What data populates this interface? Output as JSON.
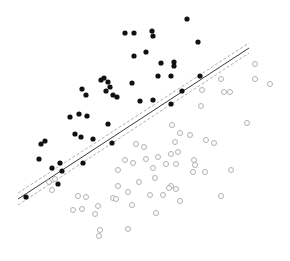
{
  "figure": {
    "width": 290,
    "height": 261,
    "background_color": "#ffffff",
    "has_axes": false,
    "has_border": false,
    "has_gridlines": false,
    "has_tick_labels": false,
    "title": "",
    "xlabel": "",
    "ylabel": ""
  },
  "style": {
    "filled_marker_color": "#111111",
    "filled_marker_radius": 2.6,
    "open_marker_stroke": "#a8a8a8",
    "open_marker_fill": "#ffffff",
    "open_marker_radius": 2.5,
    "open_marker_stroke_width": 0.9,
    "fit_line_color": "#3a3a3a",
    "fit_line_width": 1.0,
    "band_line_color": "#9a9a9a",
    "band_line_width": 0.8,
    "band_dash": "3 2"
  },
  "chart_data": {
    "type": "scatter",
    "title": "",
    "xlabel": "",
    "ylabel": "",
    "xlim": [
      0,
      290
    ],
    "ylim": [
      261,
      0
    ],
    "grid": false,
    "legend_position": "none",
    "annotations": [],
    "series": [
      {
        "name": "filled-group",
        "marker": "filled-circle",
        "color": "#111111",
        "count": 45,
        "points": [
          [
            187,
            19
          ],
          [
            125,
            33
          ],
          [
            134,
            33
          ],
          [
            152,
            31
          ],
          [
            153,
            36
          ],
          [
            198,
            42
          ],
          [
            134,
            56
          ],
          [
            146,
            52
          ],
          [
            161,
            63
          ],
          [
            174,
            62
          ],
          [
            174,
            66
          ],
          [
            158,
            76
          ],
          [
            171,
            76
          ],
          [
            101,
            80
          ],
          [
            104,
            78
          ],
          [
            108,
            82
          ],
          [
            110,
            87
          ],
          [
            106,
            91
          ],
          [
            132,
            83
          ],
          [
            82,
            89
          ],
          [
            86,
            95
          ],
          [
            113,
            95
          ],
          [
            117,
            97
          ],
          [
            200,
            76
          ],
          [
            182,
            91
          ],
          [
            140,
            101
          ],
          [
            153,
            100
          ],
          [
            171,
            104
          ],
          [
            70,
            117
          ],
          [
            79,
            114
          ],
          [
            87,
            116
          ],
          [
            108,
            124
          ],
          [
            75,
            134
          ],
          [
            81,
            137
          ],
          [
            93,
            139
          ],
          [
            41,
            144
          ],
          [
            45,
            141
          ],
          [
            112,
            143
          ],
          [
            39,
            159
          ],
          [
            60,
            163
          ],
          [
            62,
            171
          ],
          [
            83,
            163
          ],
          [
            52,
            168
          ],
          [
            58,
            184
          ],
          [
            26,
            197
          ]
        ]
      },
      {
        "name": "open-group",
        "marker": "open-circle",
        "color": "#a8a8a8",
        "count": 55,
        "points": [
          [
            255,
            64
          ],
          [
            221,
            79
          ],
          [
            255,
            79
          ],
          [
            270,
            84
          ],
          [
            202,
            90
          ],
          [
            224,
            92
          ],
          [
            230,
            92
          ],
          [
            201,
            106
          ],
          [
            247,
            123
          ],
          [
            172,
            125
          ],
          [
            180,
            133
          ],
          [
            190,
            135
          ],
          [
            175,
            142
          ],
          [
            206,
            140
          ],
          [
            214,
            143
          ],
          [
            136,
            144
          ],
          [
            144,
            147
          ],
          [
            171,
            154
          ],
          [
            178,
            152
          ],
          [
            194,
            160
          ],
          [
            158,
            157
          ],
          [
            166,
            164
          ],
          [
            176,
            164
          ],
          [
            195,
            165
          ],
          [
            125,
            160
          ],
          [
            133,
            163
          ],
          [
            146,
            159
          ],
          [
            153,
            168
          ],
          [
            118,
            170
          ],
          [
            155,
            178
          ],
          [
            193,
            172
          ],
          [
            205,
            172
          ],
          [
            139,
            182
          ],
          [
            171,
            186
          ],
          [
            231,
            170
          ],
          [
            118,
            186
          ],
          [
            128,
            192
          ],
          [
            169,
            188
          ],
          [
            78,
            196
          ],
          [
            86,
            197
          ],
          [
            52,
            190
          ],
          [
            73,
            210
          ],
          [
            82,
            209
          ],
          [
            113,
            198
          ],
          [
            116,
            199
          ],
          [
            150,
            195
          ],
          [
            176,
            189
          ],
          [
            180,
            201
          ],
          [
            221,
            196
          ],
          [
            95,
            214
          ],
          [
            98,
            206
          ],
          [
            132,
            205
          ],
          [
            156,
            213
          ],
          [
            100,
            230
          ],
          [
            99,
            236
          ],
          [
            128,
            229
          ],
          [
            49,
            182
          ],
          [
            55,
            179
          ],
          [
            163,
            195
          ]
        ]
      }
    ],
    "fit_line": {
      "name": "regression-line",
      "style": "solid",
      "x1": 18,
      "y1": 199,
      "x2": 249,
      "y2": 48
    },
    "confidence_bands": [
      {
        "name": "upper-band",
        "style": "dashed",
        "x1": 18,
        "y1": 193,
        "x2": 249,
        "y2": 43
      },
      {
        "name": "lower-band",
        "style": "dashed",
        "x1": 18,
        "y1": 205,
        "x2": 249,
        "y2": 53
      }
    ]
  }
}
